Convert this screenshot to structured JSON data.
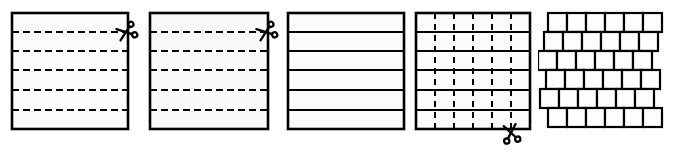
{
  "diagram": {
    "background_color": "#ffffff",
    "ink_color": "#000000",
    "sheet_fill": "#fbfbfb",
    "step_count": 5
  },
  "panels": [
    {
      "id": "panel-1",
      "name": "sheet-with-horizontal-dashed-guides",
      "step_number": 1,
      "caption": "",
      "sheet": {
        "x": 12,
        "y": 13,
        "width": 116,
        "height": 116,
        "stroke_width": 2.6,
        "fill": "#fcfcfc"
      },
      "guide_lines": {
        "orientation": "horizontal",
        "style": "dashed",
        "count": 5,
        "dash_pattern": "7 4",
        "stroke_width": 2.0,
        "positions": [
          32,
          51,
          70,
          90,
          110
        ]
      },
      "scissors": {
        "present": true,
        "glyph": "scissors",
        "x": 126,
        "y": 32,
        "size": 19,
        "rotation": -20
      }
    },
    {
      "id": "panel-2",
      "name": "sheet-with-horizontal-dashed-guides-repeat",
      "step_number": 2,
      "caption": "",
      "sheet": {
        "x": 10,
        "y": 13,
        "width": 118,
        "height": 116,
        "stroke_width": 2.6,
        "fill": "#fafafa"
      },
      "guide_lines": {
        "orientation": "horizontal",
        "style": "dashed",
        "count": 5,
        "dash_pattern": "7 4",
        "stroke_width": 2.0,
        "positions": [
          32,
          51,
          70,
          90,
          110
        ]
      },
      "scissors": {
        "present": true,
        "glyph": "scissors",
        "x": 126,
        "y": 32,
        "size": 19,
        "rotation": -20
      }
    },
    {
      "id": "panel-3",
      "name": "sheet-cut-into-horizontal-strips",
      "step_number": 3,
      "caption": "",
      "sheet": {
        "x": 6,
        "y": 13,
        "width": 116,
        "height": 116,
        "stroke_width": 2.6,
        "fill": "#fbfbfb"
      },
      "guide_lines": {
        "orientation": "horizontal",
        "style": "solid",
        "count": 5,
        "stroke_width": 2.2,
        "positions": [
          32,
          51,
          70,
          90,
          110
        ]
      },
      "scissors": {
        "present": false,
        "glyph": "",
        "x": 0,
        "y": 0,
        "size": 0,
        "rotation": 0
      }
    },
    {
      "id": "panel-4",
      "name": "strips-with-vertical-dashed-guides",
      "step_number": 4,
      "caption": "",
      "sheet": {
        "x": 6,
        "y": 13,
        "width": 114,
        "height": 116,
        "stroke_width": 2.6,
        "fill": "#fbfbfb"
      },
      "guide_lines": {
        "orientation": "horizontal",
        "style": "solid",
        "count": 5,
        "stroke_width": 2.2,
        "positions": [
          32,
          51,
          70,
          90,
          110
        ]
      },
      "cut_lines": {
        "orientation": "vertical",
        "style": "dashed",
        "count": 5,
        "dash_pattern": "6 5",
        "stroke_width": 2.0,
        "positions": [
          25,
          44,
          63,
          82,
          101
        ]
      },
      "scissors": {
        "present": true,
        "glyph": "scissors",
        "x": 101,
        "y": 133,
        "size": 19,
        "rotation": 80
      }
    },
    {
      "id": "panel-5",
      "name": "finished-stack-of-cut-squares",
      "step_number": 5,
      "caption": "",
      "grid": {
        "rows": 6,
        "columns": 6,
        "cell_width": 19,
        "cell_height": 19,
        "stroke_width": 2.2,
        "fill": "#fdfdfd",
        "row_offsets": [
          10,
          6,
          0,
          8,
          2,
          10
        ],
        "row_tops": [
          13,
          32,
          51,
          70,
          89,
          108
        ]
      },
      "scissors": {
        "present": false,
        "glyph": "",
        "x": 0,
        "y": 0,
        "size": 0,
        "rotation": 0
      }
    }
  ]
}
